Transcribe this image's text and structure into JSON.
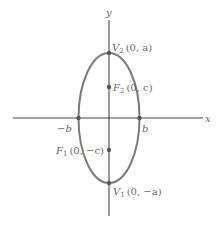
{
  "diagram": {
    "axes": {
      "x_label": "x",
      "y_label": "y"
    },
    "points": {
      "v2": {
        "name": "V",
        "sub": "2",
        "coords": "(0, a)"
      },
      "f2": {
        "name": "F",
        "sub": "2",
        "coords": "(0, c)"
      },
      "f1": {
        "name": "F",
        "sub": "1",
        "coords": "(0, −c)"
      },
      "v1": {
        "name": "V",
        "sub": "1",
        "coords": "(0, −a)"
      },
      "neg_b": {
        "label": "−b"
      },
      "pos_b": {
        "label": "b"
      }
    },
    "colors": {
      "axis": "#333333",
      "ellipse": "#777777",
      "point": "#555555",
      "label": "#666666"
    }
  }
}
